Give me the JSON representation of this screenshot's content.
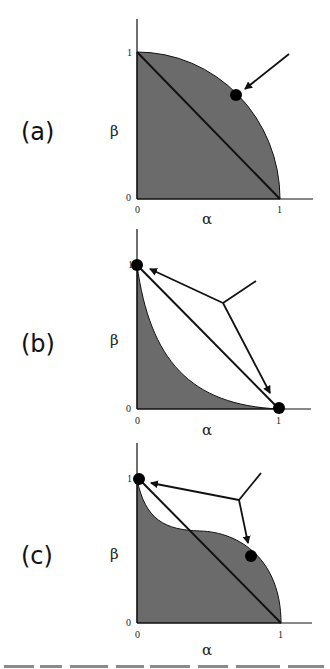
{
  "figure": {
    "panels": [
      {
        "id": "a",
        "label": "(a)",
        "xlabel": "α",
        "ylabel": "β",
        "x_ticks": [
          "0",
          "1"
        ],
        "y_ticks": [
          "0",
          "1"
        ],
        "description": "Shaded quarter-circle region under concave curve from (0,1) to (1,0); diagonal line from (0,1) to (1,0); single dot on curve indicated by arrow"
      },
      {
        "id": "b",
        "label": "(b)",
        "xlabel": "α",
        "ylabel": "β",
        "x_ticks": [
          "0",
          "1"
        ],
        "y_ticks": [
          "0",
          "1"
        ],
        "description": "Shaded region under convex curve from (0,1) to (1,0); diagonal line; dots at (0,1) and (1,0) indicated by forked arrow"
      },
      {
        "id": "c",
        "label": "(c)",
        "xlabel": "α",
        "ylabel": "β",
        "x_ticks": [
          "0",
          "1"
        ],
        "y_ticks": [
          "0",
          "1"
        ],
        "description": "Shaded region under S-shaped curve (convex then concave); diagonal line; dots at (0,1) and on the concave part indicated by forked arrow"
      }
    ],
    "colors": {
      "shade": "#6b6b6b",
      "line": "#111111",
      "background": "#ffffff"
    }
  }
}
